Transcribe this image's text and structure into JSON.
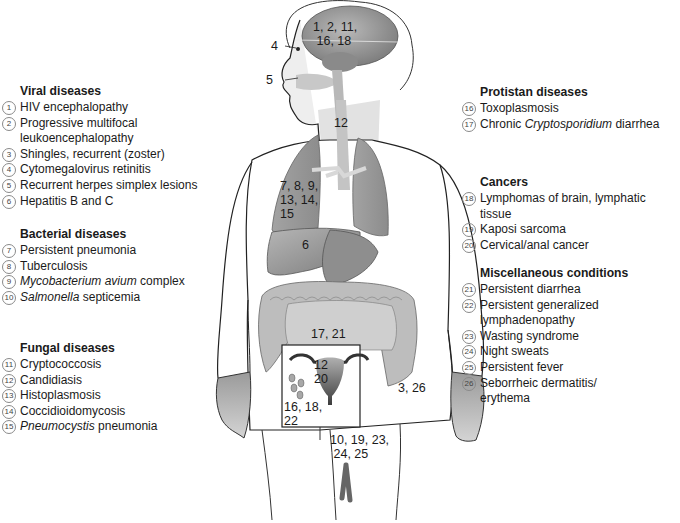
{
  "legend_groups": [
    {
      "id": "viral",
      "title": "Viral diseases",
      "items": [
        {
          "num": "1",
          "label": "HIV encephalopathy"
        },
        {
          "num": "2",
          "label": "Progressive multifocal",
          "label2": "leukoencephalopathy"
        },
        {
          "num": "3",
          "label": "Shingles, recurrent (zoster)"
        },
        {
          "num": "4",
          "label": "Cytomegalovirus retinitis"
        },
        {
          "num": "5",
          "label": "Recurrent herpes simplex lesions"
        },
        {
          "num": "6",
          "label": "Hepatitis B and C"
        }
      ]
    },
    {
      "id": "bacterial",
      "title": "Bacterial diseases",
      "items": [
        {
          "num": "7",
          "label": "Persistent pneumonia"
        },
        {
          "num": "8",
          "label": "Tuberculosis"
        },
        {
          "num": "9",
          "italic": "Mycobacterium avium",
          "label": " complex"
        },
        {
          "num": "10",
          "italic": "Salmonella",
          "label": " septicemia"
        }
      ]
    },
    {
      "id": "fungal",
      "title": "Fungal diseases",
      "items": [
        {
          "num": "11",
          "label": "Cryptococcosis"
        },
        {
          "num": "12",
          "label": "Candidiasis"
        },
        {
          "num": "13",
          "label": "Histoplasmosis"
        },
        {
          "num": "14",
          "label": "Coccidioidomycosis"
        },
        {
          "num": "15",
          "italic": "Pneumocystis",
          "label": " pneumonia"
        }
      ]
    },
    {
      "id": "protistan",
      "title": "Protistan diseases",
      "items": [
        {
          "num": "16",
          "label": "Toxoplasmosis"
        },
        {
          "num": "17",
          "pre": "Chronic ",
          "italic": "Cryptosporidium",
          "label": " diarrhea"
        }
      ]
    },
    {
      "id": "cancers",
      "title": "Cancers",
      "items": [
        {
          "num": "18",
          "label": "Lymphomas of brain, lymphatic tissue"
        },
        {
          "num": "19",
          "label": "Kaposi sarcoma"
        },
        {
          "num": "20",
          "label": "Cervical/anal cancer"
        }
      ]
    },
    {
      "id": "misc",
      "title": "Miscellaneous conditions",
      "items": [
        {
          "num": "21",
          "label": "Persistent diarrhea"
        },
        {
          "num": "22",
          "label": "Persistent generalized",
          "label2": "lymphadenopathy"
        },
        {
          "num": "23",
          "label": "Wasting syndrome"
        },
        {
          "num": "24",
          "label": "Night sweats"
        },
        {
          "num": "25",
          "label": "Persistent fever"
        },
        {
          "num": "26",
          "label": "Seborrheic dermatitis/",
          "label2": "erythema"
        }
      ]
    }
  ],
  "body_labels": {
    "brain": "1, 2, 11,\n 16, 18",
    "eye": "4",
    "mouth": "5",
    "esophagus": "12",
    "lungs": "7, 8, 9,\n13, 14,\n15",
    "liver": "6",
    "intestine": "17, 21",
    "uterus": "12\n20",
    "lymph_nodes": "16, 18,\n22",
    "hand": "3, 26",
    "genital": "10, 19, 23,\n 24, 25"
  },
  "colors": {
    "organ_dark": "#7d7d7d",
    "organ_mid": "#a9a9a9",
    "organ_light": "#cfcfcf",
    "outline": "#222222"
  }
}
